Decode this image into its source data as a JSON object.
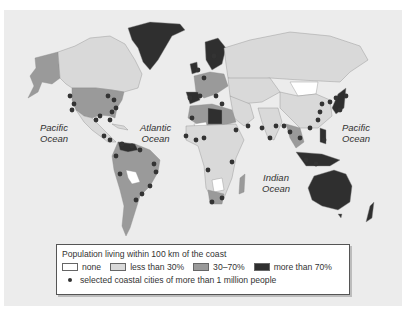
{
  "map": {
    "ocean_labels": [
      {
        "id": "pacific-west",
        "line1": "Pacific",
        "line2": "Ocean"
      },
      {
        "id": "atlantic",
        "line1": "Atlantic",
        "line2": "Ocean"
      },
      {
        "id": "indian",
        "line1": "Indian",
        "line2": "Ocean"
      },
      {
        "id": "pacific-east",
        "line1": "Pacific",
        "line2": "Ocean"
      }
    ],
    "colors": {
      "background": "#ececec",
      "none": "#ffffff",
      "less_than_30": "#d9d9d9",
      "30_70": "#9a9a9a",
      "more_than_70": "#2f2f2f",
      "city_dot": "#333333",
      "border": "#888888"
    }
  },
  "legend": {
    "title": "Population living within 100 km of the coast",
    "categories": [
      {
        "label": "none",
        "color": "#ffffff"
      },
      {
        "label": "less than 30%",
        "color": "#d9d9d9"
      },
      {
        "label": "30–70%",
        "color": "#9a9a9a"
      },
      {
        "label": "more than 70%",
        "color": "#2f2f2f"
      }
    ],
    "cities_label": "selected coastal cities of more than 1 million people"
  }
}
